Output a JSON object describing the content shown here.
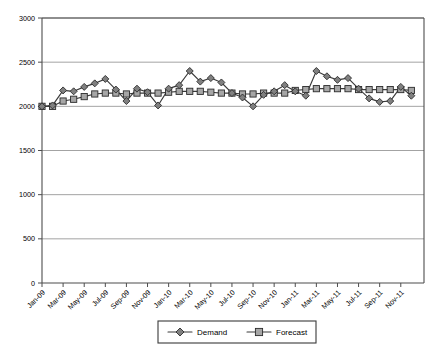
{
  "chart_data": {
    "type": "line",
    "title": "",
    "xlabel": "",
    "ylabel": "",
    "ylim": [
      0,
      3000
    ],
    "ytick_step": 500,
    "ytick_labels": [
      "3000",
      "2500",
      "2000",
      "1500",
      "1000",
      "500",
      "0"
    ],
    "ytick_values": [
      3000,
      2500,
      2000,
      1500,
      1000,
      500,
      0
    ],
    "grid": true,
    "legend_position": "bottom-center",
    "x": [
      "Jan-09",
      "Feb-09",
      "Mar-09",
      "Apr-09",
      "May-09",
      "Jun-09",
      "Jul-09",
      "Aug-09",
      "Sep-09",
      "Oct-09",
      "Nov-09",
      "Dec-09",
      "Jan-10",
      "Feb-10",
      "Mar-10",
      "Apr-10",
      "May-10",
      "Jun-10",
      "Jul-10",
      "Aug-10",
      "Sep-10",
      "Oct-10",
      "Nov-10",
      "Dec-10",
      "Jan-11",
      "Feb-11",
      "Mar-11",
      "Apr-11",
      "May-11",
      "Jun-11",
      "Jul-11",
      "Aug-11",
      "Sep-11",
      "Oct-11",
      "Nov-11",
      "Dec-11"
    ],
    "xtick_labels": [
      "Jan-09",
      "Mar-09",
      "May-09",
      "Jul-09",
      "Sep-09",
      "Nov-09",
      "Jan-10",
      "Mar-10",
      "May-10",
      "Jul-10",
      "Sep-10",
      "Nov-10",
      "Jan-11",
      "Mar-11",
      "May-11",
      "Jul-11",
      "Sep-11",
      "Nov-11"
    ],
    "xtick_indices": [
      0,
      2,
      4,
      6,
      8,
      10,
      12,
      14,
      16,
      18,
      20,
      22,
      24,
      26,
      28,
      30,
      32,
      34
    ],
    "series": [
      {
        "name": "Demand",
        "marker": "diamond",
        "color": "#808080",
        "values": [
          2000,
          2010,
          2180,
          2170,
          2220,
          2260,
          2310,
          2190,
          2060,
          2200,
          2160,
          2010,
          2200,
          2240,
          2400,
          2280,
          2320,
          2270,
          2150,
          2100,
          2000,
          2130,
          2170,
          2240,
          2170,
          2120,
          2400,
          2340,
          2300,
          2320,
          2200,
          2090,
          2050,
          2060,
          2220,
          2120
        ]
      },
      {
        "name": "Forecast",
        "marker": "square",
        "color": "#a6a6a6",
        "values": [
          2000,
          2000,
          2060,
          2080,
          2110,
          2140,
          2150,
          2150,
          2140,
          2150,
          2150,
          2150,
          2160,
          2170,
          2170,
          2170,
          2160,
          2150,
          2150,
          2140,
          2140,
          2150,
          2150,
          2150,
          2180,
          2190,
          2200,
          2200,
          2200,
          2200,
          2190,
          2190,
          2190,
          2190,
          2190,
          2180
        ]
      }
    ],
    "legend": [
      {
        "label": "Demand",
        "marker": "diamond"
      },
      {
        "label": "Forecast",
        "marker": "square"
      }
    ]
  }
}
